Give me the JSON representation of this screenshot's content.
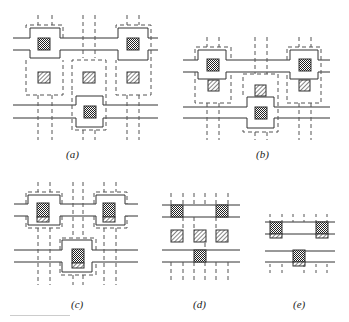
{
  "figure": {
    "panels": [
      {
        "id": "a",
        "label": "(a)"
      },
      {
        "id": "b",
        "label": "(b)"
      },
      {
        "id": "c",
        "label": "(c)"
      },
      {
        "id": "d",
        "label": "(d)"
      },
      {
        "id": "e",
        "label": "(e)"
      }
    ],
    "legend_patterns": {
      "checker": "contact (cross-hatched square)",
      "diagonal": "via (diagonal-hatched square)"
    },
    "colors": {
      "line": "#333333",
      "dash": "#555555",
      "background": "#ffffff"
    }
  }
}
